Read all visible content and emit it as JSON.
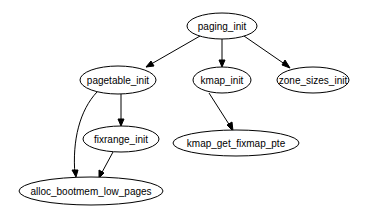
{
  "diagram": {
    "type": "call-graph",
    "nodes": [
      {
        "id": "paging_init",
        "label": "paging_init"
      },
      {
        "id": "pagetable_init",
        "label": "pagetable_init"
      },
      {
        "id": "kmap_init",
        "label": "kmap_init"
      },
      {
        "id": "zone_sizes_init",
        "label": "zone_sizes_init"
      },
      {
        "id": "fixrange_init",
        "label": "fixrange_init"
      },
      {
        "id": "kmap_get_fixmap_pte",
        "label": "kmap_get_fixmap_pte"
      },
      {
        "id": "alloc_bootmem_low_pages",
        "label": "alloc_bootmem_low_pages"
      }
    ],
    "edges": [
      {
        "from": "paging_init",
        "to": "pagetable_init"
      },
      {
        "from": "paging_init",
        "to": "kmap_init"
      },
      {
        "from": "paging_init",
        "to": "zone_sizes_init"
      },
      {
        "from": "pagetable_init",
        "to": "fixrange_init"
      },
      {
        "from": "pagetable_init",
        "to": "alloc_bootmem_low_pages"
      },
      {
        "from": "fixrange_init",
        "to": "alloc_bootmem_low_pages"
      },
      {
        "from": "kmap_init",
        "to": "kmap_get_fixmap_pte"
      }
    ]
  }
}
